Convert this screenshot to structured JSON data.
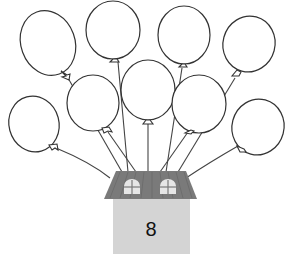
{
  "scene": {
    "description": "Nine empty balloons tied to a house",
    "house_number": "8",
    "balloon_count": 9,
    "colors": {
      "balloon_fill": "#ffffff",
      "balloon_stroke": "#333333",
      "roof": "#7a7a7a",
      "roof_stripe": "#6e6e6e",
      "wall": "#d4d4d4",
      "window": "#e6e6e6"
    }
  }
}
